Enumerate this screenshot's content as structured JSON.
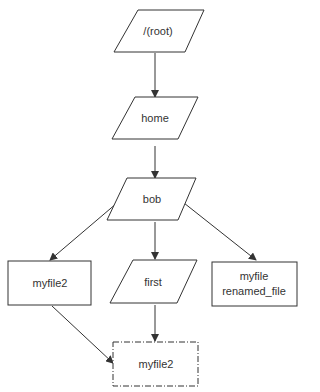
{
  "diagram": {
    "type": "flowchart",
    "colors": {
      "stroke": "#333333",
      "fill": "#ffffff",
      "text": "#333333"
    },
    "nodes": [
      {
        "id": "root",
        "label": "/(root)",
        "shape": "parallelogram"
      },
      {
        "id": "home",
        "label": "home",
        "shape": "parallelogram"
      },
      {
        "id": "bob",
        "label": "bob",
        "shape": "parallelogram"
      },
      {
        "id": "myfile2",
        "label": "myfile2",
        "shape": "rectangle"
      },
      {
        "id": "first",
        "label": "first",
        "shape": "parallelogram"
      },
      {
        "id": "myfile",
        "label": "myfile",
        "sublabel": "renamed_file",
        "shape": "rectangle"
      },
      {
        "id": "myfile2_dashed",
        "label": "myfile2",
        "shape": "dash-dot-rectangle"
      }
    ],
    "edges": [
      {
        "from": "root",
        "to": "home"
      },
      {
        "from": "home",
        "to": "bob"
      },
      {
        "from": "bob",
        "to": "myfile2"
      },
      {
        "from": "bob",
        "to": "first"
      },
      {
        "from": "bob",
        "to": "myfile"
      },
      {
        "from": "myfile2",
        "to": "myfile2_dashed"
      },
      {
        "from": "first",
        "to": "myfile2_dashed"
      }
    ]
  }
}
